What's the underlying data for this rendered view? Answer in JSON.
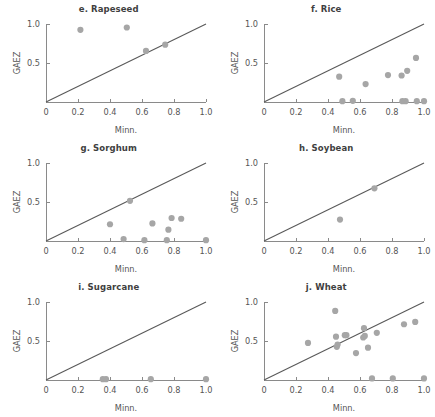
{
  "figure": {
    "xlabel": "Minn.",
    "ylabel": "GAEZ",
    "xticks": [
      "0",
      "0.2",
      "0.4",
      "0.6",
      "0.8",
      "1.0"
    ],
    "xtickvals": [
      0,
      0.2,
      0.4,
      0.6,
      0.8,
      1.0
    ],
    "yticks": [
      "0.5",
      "1.0"
    ],
    "ytickvals": [
      0.5,
      1.0
    ],
    "xlim": [
      0,
      1.0
    ],
    "ylim": [
      0,
      1.0
    ],
    "marker_color": "#a6a6a6",
    "line_color": "#595959",
    "axis_color": "#8a8a8a",
    "text_color": "#555555",
    "title_color": "#3f3f3f",
    "background": "#ffffff"
  },
  "chart_data": [
    {
      "type": "scatter",
      "title": "e. Rapeseed",
      "xlabel": "Minn.",
      "ylabel": "GAEZ",
      "xlim": [
        0,
        1.0
      ],
      "ylim": [
        0,
        1.0
      ],
      "grid": false,
      "legend": "none",
      "reference_line": {
        "type": "identity",
        "from": [
          0,
          0
        ],
        "to": [
          1.0,
          1.0
        ]
      },
      "points": [
        {
          "x": 0.215,
          "y": 0.925
        },
        {
          "x": 0.505,
          "y": 0.955
        },
        {
          "x": 0.625,
          "y": 0.655
        },
        {
          "x": 0.745,
          "y": 0.735
        }
      ]
    },
    {
      "type": "scatter",
      "title": "f. Rice",
      "xlabel": "Minn.",
      "ylabel": "GAEZ",
      "xlim": [
        0,
        1.0
      ],
      "ylim": [
        0,
        1.0
      ],
      "grid": false,
      "legend": "none",
      "reference_line": {
        "type": "identity",
        "from": [
          0,
          0
        ],
        "to": [
          1.0,
          1.0
        ]
      },
      "points": [
        {
          "x": 0.47,
          "y": 0.325
        },
        {
          "x": 0.49,
          "y": 0.01
        },
        {
          "x": 0.555,
          "y": 0.015
        },
        {
          "x": 0.635,
          "y": 0.23
        },
        {
          "x": 0.775,
          "y": 0.345
        },
        {
          "x": 0.86,
          "y": 0.34
        },
        {
          "x": 0.865,
          "y": 0.01
        },
        {
          "x": 0.885,
          "y": 0.01
        },
        {
          "x": 0.895,
          "y": 0.4
        },
        {
          "x": 0.95,
          "y": 0.565
        },
        {
          "x": 0.955,
          "y": 0.01
        },
        {
          "x": 1.0,
          "y": 0.01
        }
      ]
    },
    {
      "type": "scatter",
      "title": "g. Sorghum",
      "xlabel": "Minn.",
      "ylabel": "GAEZ",
      "xlim": [
        0,
        1.0
      ],
      "ylim": [
        0,
        1.0
      ],
      "grid": false,
      "legend": "none",
      "reference_line": {
        "type": "identity",
        "from": [
          0,
          0
        ],
        "to": [
          1.0,
          1.0
        ]
      },
      "points": [
        {
          "x": 0.4,
          "y": 0.215
        },
        {
          "x": 0.485,
          "y": 0.025
        },
        {
          "x": 0.525,
          "y": 0.515
        },
        {
          "x": 0.615,
          "y": 0.01
        },
        {
          "x": 0.665,
          "y": 0.225
        },
        {
          "x": 0.755,
          "y": 0.01
        },
        {
          "x": 0.765,
          "y": 0.145
        },
        {
          "x": 0.785,
          "y": 0.295
        },
        {
          "x": 0.845,
          "y": 0.285
        },
        {
          "x": 1.0,
          "y": 0.01
        }
      ]
    },
    {
      "type": "scatter",
      "title": "h. Soybean",
      "xlabel": "Minn.",
      "ylabel": "GAEZ",
      "xlim": [
        0,
        1.0
      ],
      "ylim": [
        0,
        1.0
      ],
      "grid": false,
      "legend": "none",
      "reference_line": {
        "type": "identity",
        "from": [
          0,
          0
        ],
        "to": [
          1.0,
          1.0
        ]
      },
      "points": [
        {
          "x": 0.475,
          "y": 0.275
        },
        {
          "x": 0.69,
          "y": 0.675
        }
      ]
    },
    {
      "type": "scatter",
      "title": "i. Sugarcane",
      "xlabel": "Minn.",
      "ylabel": "GAEZ",
      "xlim": [
        0,
        1.0
      ],
      "ylim": [
        0,
        1.0
      ],
      "grid": false,
      "legend": "none",
      "reference_line": {
        "type": "identity",
        "from": [
          0,
          0
        ],
        "to": [
          1.0,
          1.0
        ]
      },
      "points": [
        {
          "x": 0.355,
          "y": 0.01
        },
        {
          "x": 0.375,
          "y": 0.01
        },
        {
          "x": 0.655,
          "y": 0.01
        },
        {
          "x": 1.0,
          "y": 0.01
        }
      ]
    },
    {
      "type": "scatter",
      "title": "j. Wheat",
      "xlabel": "Minn.",
      "ylabel": "GAEZ",
      "xlim": [
        0,
        1.0
      ],
      "ylim": [
        0,
        1.0
      ],
      "grid": false,
      "legend": "none",
      "reference_line": {
        "type": "identity",
        "from": [
          0,
          0
        ],
        "to": [
          1.0,
          1.0
        ]
      },
      "points": [
        {
          "x": 0.275,
          "y": 0.475
        },
        {
          "x": 0.445,
          "y": 0.885
        },
        {
          "x": 0.45,
          "y": 0.555
        },
        {
          "x": 0.455,
          "y": 0.425
        },
        {
          "x": 0.46,
          "y": 0.455
        },
        {
          "x": 0.505,
          "y": 0.575
        },
        {
          "x": 0.515,
          "y": 0.575
        },
        {
          "x": 0.575,
          "y": 0.345
        },
        {
          "x": 0.62,
          "y": 0.545
        },
        {
          "x": 0.625,
          "y": 0.665
        },
        {
          "x": 0.63,
          "y": 0.565
        },
        {
          "x": 0.65,
          "y": 0.415
        },
        {
          "x": 0.675,
          "y": 0.02
        },
        {
          "x": 0.705,
          "y": 0.605
        },
        {
          "x": 0.805,
          "y": 0.02
        },
        {
          "x": 0.875,
          "y": 0.715
        },
        {
          "x": 0.945,
          "y": 0.745
        },
        {
          "x": 1.0,
          "y": 0.02
        }
      ]
    }
  ]
}
